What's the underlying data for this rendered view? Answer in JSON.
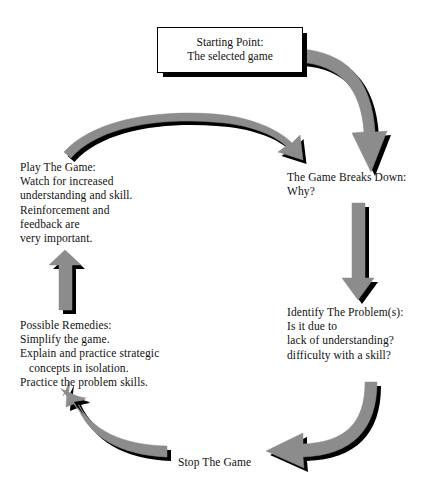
{
  "diagram": {
    "colors": {
      "arrow_fill": "#8c8c8c",
      "arrow_shadow": "#000000",
      "text": "#111111",
      "background": "#ffffff",
      "box_border": "#000000"
    },
    "nodes": {
      "start": {
        "name": "starting-point",
        "line1": "Starting Point:",
        "line2": "The selected game"
      },
      "breaks_down": {
        "name": "game-breaks-down",
        "line1": "The Game Breaks Down:",
        "line2": "Why?"
      },
      "identify": {
        "name": "identify-the-problem",
        "line1": "Identify The Problem(s):",
        "line2": "Is it due to",
        "line3": "lack of understanding?",
        "line4": "difficulty with a skill?"
      },
      "stop": {
        "name": "stop-the-game",
        "line1": "Stop The Game"
      },
      "remedies": {
        "name": "possible-remedies",
        "line1": "Possible Remedies:",
        "line2": "Simplify the game.",
        "line3": "Explain and practice strategic",
        "line4": "concepts in isolation.",
        "line5": "Practice the problem skills."
      },
      "play": {
        "name": "play-the-game",
        "line1": "Play The Game:",
        "line2": "Watch for increased",
        "line3": "understanding and skill.",
        "line4": "Reinforcement and",
        "line5": "feedback are",
        "line6": "very important."
      }
    },
    "arrows": [
      {
        "name": "arrow-start-to-breaks-down",
        "from": "start",
        "to": "breaks_down",
        "shape": "curve-right-down",
        "direction": "down"
      },
      {
        "name": "arrow-breaks-down-to-identify",
        "from": "breaks_down",
        "to": "identify",
        "shape": "straight",
        "direction": "down"
      },
      {
        "name": "arrow-identify-to-stop",
        "from": "identify",
        "to": "stop",
        "shape": "curve-down-left",
        "direction": "left"
      },
      {
        "name": "arrow-stop-to-remedies",
        "from": "stop",
        "to": "remedies",
        "shape": "curve-left-up",
        "direction": "up-left"
      },
      {
        "name": "arrow-remedies-to-play",
        "from": "remedies",
        "to": "play",
        "shape": "straight",
        "direction": "up"
      },
      {
        "name": "arrow-play-to-breaks-down",
        "from": "play",
        "to": "breaks_down",
        "shape": "arch-over",
        "direction": "right-down"
      }
    ]
  }
}
